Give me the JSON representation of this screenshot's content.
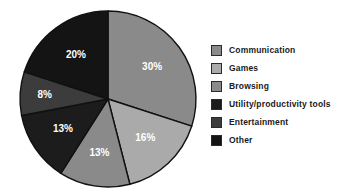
{
  "chart_data": {
    "type": "pie",
    "title": "",
    "categories": [
      "Communication",
      "Games",
      "Browsing",
      "Utility/productivity tools",
      "Entertainment",
      "Other"
    ],
    "values": [
      30,
      16,
      13,
      13,
      8,
      20
    ],
    "labels": [
      "30%",
      "16%",
      "13%",
      "13%",
      "8%",
      "20%"
    ],
    "colors": [
      "#8a8a8a",
      "#aaaaaa",
      "#8a8a8a",
      "#1c1c1c",
      "#3c3c3c",
      "#141414"
    ],
    "start_angle_deg": 0,
    "direction": "clockwise",
    "legend_position": "right",
    "grid": false,
    "slice_label_color": "#ffffff",
    "background": "#ffffff",
    "outline_color": "#111111"
  },
  "legend": {
    "items": [
      {
        "label": "Communication",
        "color": "#8a8a8a",
        "value": "30%"
      },
      {
        "label": "Games",
        "color": "#aaaaaa",
        "value": "16%"
      },
      {
        "label": "Browsing",
        "color": "#8a8a8a",
        "value": "13%"
      },
      {
        "label": "Utility/productivity tools",
        "color": "#1c1c1c",
        "value": "13%"
      },
      {
        "label": "Entertainment",
        "color": "#3c3c3c",
        "value": "8%"
      },
      {
        "label": "Other",
        "color": "#141414",
        "value": "20%"
      }
    ]
  },
  "pie": {
    "center_x": 108,
    "center_y": 99,
    "radius": 88,
    "slice_labels": [
      "30%",
      "16%",
      "13%",
      "13%",
      "8%",
      "20%"
    ]
  }
}
